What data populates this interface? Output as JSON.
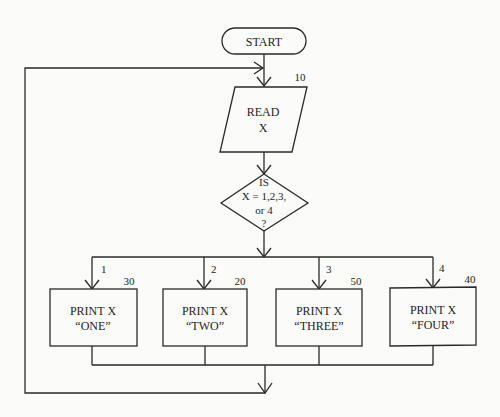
{
  "diagram": {
    "type": "flowchart",
    "start": {
      "label": "START"
    },
    "read": {
      "line1": "READ",
      "line2": "X",
      "step": "10"
    },
    "decision": {
      "line1": "IS",
      "line2": "X = 1,2,3,",
      "line3": "or 4",
      "line4": "?"
    },
    "branches": [
      {
        "case": "1",
        "step": "30",
        "line1": "PRINT X",
        "line2": "“ONE”"
      },
      {
        "case": "2",
        "step": "20",
        "line1": "PRINT X",
        "line2": "“TWO”"
      },
      {
        "case": "3",
        "step": "50",
        "line1": "PRINT X",
        "line2": "“THREE”"
      },
      {
        "case": "4",
        "step": "40",
        "line1": "PRINT X",
        "line2": "“FOUR”"
      }
    ],
    "loop": {
      "description": "after printing, control returns to READ X"
    },
    "colors": {
      "stroke": "#2a2a2a",
      "background": "#fbfbfa",
      "text": "#1e1e1e"
    }
  }
}
